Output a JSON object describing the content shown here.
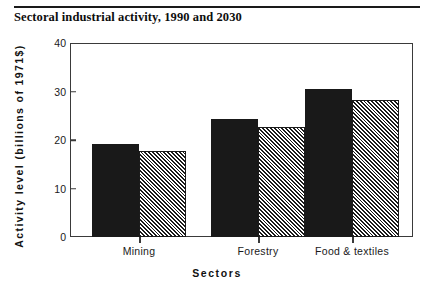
{
  "title": "Sectoral industrial activity, 1990 and 2030",
  "axis": {
    "x_title": "Sectors",
    "y_title": "Activity  level  (billions  of  1971$)"
  },
  "chart_data": {
    "type": "bar",
    "title": "Sectoral industrial activity, 1990 and 2030",
    "xlabel": "Sectors",
    "ylabel": "Activity level (billions of 1971$)",
    "categories": [
      "Mining",
      "Forestry",
      "Food & textiles"
    ],
    "yticks": [
      "0",
      "10",
      "20",
      "30",
      "40"
    ],
    "ytick_values": [
      0,
      10,
      20,
      30,
      40
    ],
    "ylim": [
      0,
      40
    ],
    "grid": false,
    "legend": "none",
    "series": [
      {
        "name": "1990",
        "style": "solid-black",
        "values": [
          19.2,
          24.3,
          30.5
        ]
      },
      {
        "name": "2030",
        "style": "diagonal-hatch",
        "values": [
          17.7,
          22.7,
          28.2
        ]
      }
    ]
  }
}
